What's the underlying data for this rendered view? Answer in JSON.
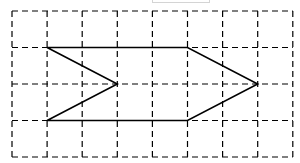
{
  "diagram": {
    "type": "grid-with-polygon",
    "grid": {
      "columns": 8,
      "rows": 4,
      "origin_x": 12,
      "origin_y": 11,
      "cell_width": 35.1,
      "cell_height": 36.5,
      "line_color": "#000000",
      "line_style": "dashed",
      "dash": "6,4"
    },
    "shape": {
      "name": "chevron-arrow",
      "stroke_color": "#000000",
      "stroke_width": 1.6,
      "vertices_grid": [
        [
          1,
          1
        ],
        [
          5,
          1
        ],
        [
          7,
          2
        ],
        [
          5,
          3
        ],
        [
          1,
          3
        ],
        [
          3,
          2
        ]
      ]
    }
  }
}
